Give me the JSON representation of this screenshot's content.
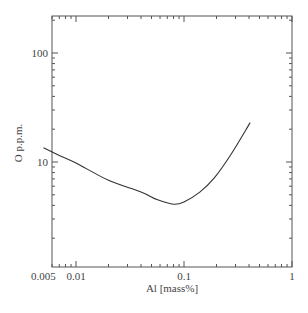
{
  "chart_data": {
    "type": "line",
    "title": "",
    "xlabel": "Al [mass%]",
    "ylabel": "O p.p.m.",
    "xscale": "log",
    "yscale": "log",
    "xlim": [
      0.005,
      1
    ],
    "ylim": [
      1,
      220
    ],
    "grid": false,
    "legend": null,
    "x_tick_labels": [
      "0.005",
      "0.01",
      "0.1",
      "1"
    ],
    "y_tick_labels": [
      "10",
      "100"
    ],
    "series": [
      {
        "name": "O solubility",
        "x": [
          0.005,
          0.007,
          0.01,
          0.02,
          0.04,
          0.057,
          0.08,
          0.1,
          0.14,
          0.19,
          0.27,
          0.41
        ],
        "y": [
          13.5,
          11.5,
          9.8,
          6.8,
          5.3,
          4.5,
          4.1,
          4.3,
          5.3,
          7.1,
          11.6,
          23
        ]
      }
    ]
  }
}
